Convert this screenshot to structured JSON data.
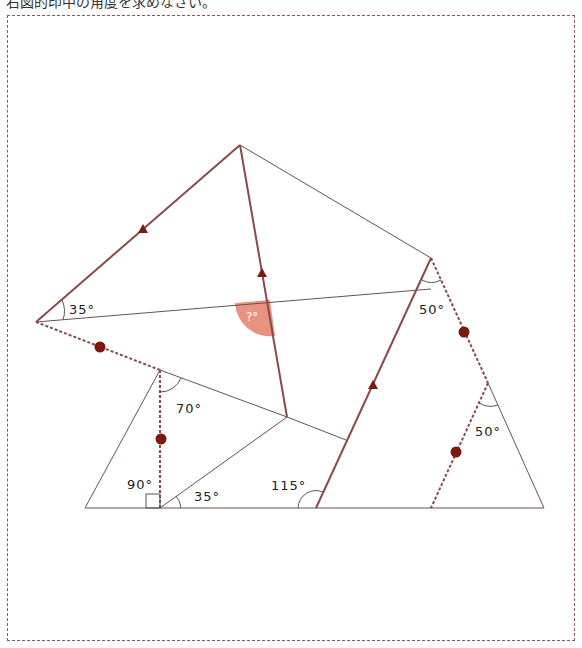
{
  "header": {
    "text": "右図的印中の角度を求めなさい。"
  },
  "colors": {
    "line": "#6b4a4a",
    "accent_line": "#8b3a3a",
    "marker": "#7a1a10",
    "unknown_fill": "#e8937f"
  },
  "angles": {
    "a35_left": "35°",
    "unknown": "?°",
    "a50_top": "50°",
    "a50_lower": "50°",
    "a70": "70°",
    "a90": "90°",
    "a35_bottom": "35°",
    "a115": "115°"
  }
}
